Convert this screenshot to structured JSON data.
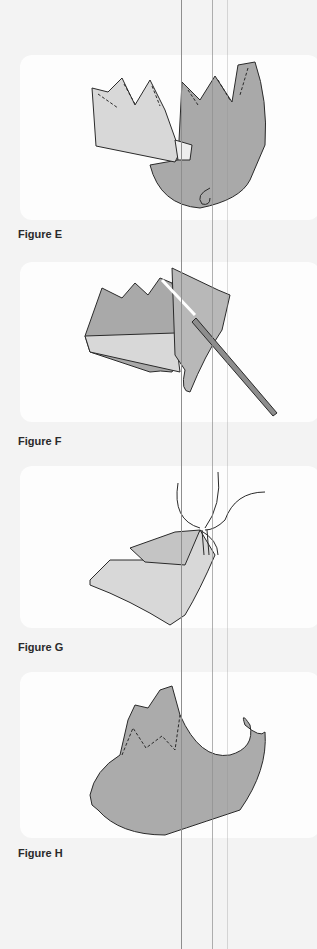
{
  "figures": [
    {
      "id": "E",
      "label": "Figure E",
      "depicts": "two paper crown-shaped pieces joined, dashed fold lines"
    },
    {
      "id": "F",
      "label": "Figure F",
      "depicts": "pieces being glued with a stick/brush"
    },
    {
      "id": "G",
      "label": "Figure G",
      "depicts": "hand holding folded piece with stick"
    },
    {
      "id": "H",
      "label": "Figure H",
      "depicts": "finished curled elf shoe with crown cuff"
    }
  ],
  "colors": {
    "background": "#f3f3f3",
    "panel": "#fdfdfd",
    "paper_light": "#d8d8d8",
    "paper_dark": "#a9a9a9",
    "stroke": "#2a2a2a"
  }
}
